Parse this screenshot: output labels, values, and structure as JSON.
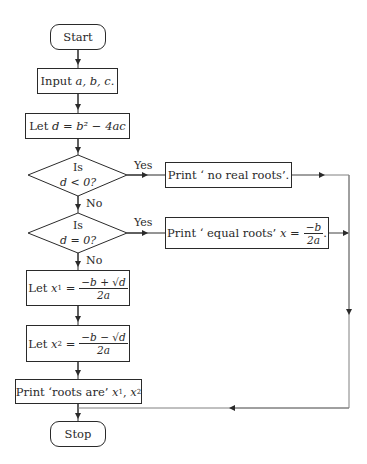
{
  "diagram": {
    "type": "flowchart",
    "nodes": {
      "start": {
        "shape": "terminator",
        "label": "Start"
      },
      "input": {
        "shape": "process",
        "label_prefix": "Input",
        "label_vars": "a, b, c."
      },
      "compute_d": {
        "shape": "process",
        "label_prefix": "Let",
        "label_expr": "d = b² − 4ac"
      },
      "decision_neg": {
        "shape": "decision",
        "line1": "Is",
        "line2": "d < 0?"
      },
      "decision_zero": {
        "shape": "decision",
        "line1": "Is",
        "line2": "d = 0?"
      },
      "print_no_real": {
        "shape": "process",
        "label": "Print ‘ no real roots’."
      },
      "print_equal": {
        "shape": "process",
        "label_prefix": "Print ‘ equal roots’",
        "label_var": "x =",
        "frac_num": "−b",
        "frac_den": "2a",
        "suffix": "."
      },
      "compute_x1": {
        "shape": "process",
        "label_prefix": "Let",
        "label_var": "x",
        "subscript": "1",
        "eq": "=",
        "frac_num": "−b + √d",
        "frac_den": "2a"
      },
      "compute_x2": {
        "shape": "process",
        "label_prefix": "Let",
        "label_var": "x",
        "subscript": "2",
        "eq": "=",
        "frac_num": "−b − √d",
        "frac_den": "2a"
      },
      "print_roots": {
        "shape": "process",
        "label_prefix": "Print ‘roots are’",
        "var1": "x",
        "sub1": "1",
        "var2": "x",
        "sub2": "2"
      },
      "stop": {
        "shape": "terminator",
        "label": "Stop"
      }
    },
    "edge_labels": {
      "yes1": "Yes",
      "no1": "No",
      "yes2": "Yes",
      "no2": "No"
    },
    "edges": [
      [
        "start",
        "input"
      ],
      [
        "input",
        "compute_d"
      ],
      [
        "compute_d",
        "decision_neg"
      ],
      [
        "decision_neg",
        "print_no_real",
        "Yes"
      ],
      [
        "decision_neg",
        "decision_zero",
        "No"
      ],
      [
        "decision_zero",
        "print_equal",
        "Yes"
      ],
      [
        "decision_zero",
        "compute_x1",
        "No"
      ],
      [
        "compute_x1",
        "compute_x2"
      ],
      [
        "compute_x2",
        "print_roots"
      ],
      [
        "print_roots",
        "stop"
      ],
      [
        "print_no_real",
        "stop"
      ],
      [
        "print_equal",
        "stop"
      ]
    ],
    "colors": {
      "stroke": "#2a2a2a",
      "connector": "#808080",
      "background": "#ffffff"
    }
  }
}
